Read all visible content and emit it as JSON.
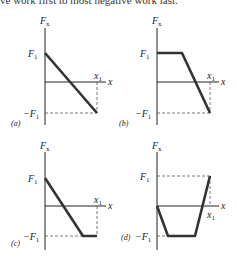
{
  "header": {
    "text": "ve work first to most negative work last."
  },
  "panels": [
    {
      "id": "a",
      "tag": "(a)",
      "y_label": "F",
      "y_sub": "x",
      "pos_label": "F",
      "pos_sub": "1",
      "neg_label": "−F",
      "neg_sub": "1",
      "x_label": "x",
      "x1_label": "x",
      "x1_sub": "1"
    },
    {
      "id": "b",
      "tag": "(b)",
      "y_label": "F",
      "y_sub": "x",
      "pos_label": "F",
      "pos_sub": "1",
      "neg_label": "−F",
      "neg_sub": "1",
      "x_label": "x",
      "x1_label": "x",
      "x1_sub": "1"
    },
    {
      "id": "c",
      "tag": "(c)",
      "y_label": "F",
      "y_sub": "x",
      "pos_label": "F",
      "pos_sub": "1",
      "neg_label": "−F",
      "neg_sub": "1",
      "x_label": "x",
      "x1_label": "x",
      "x1_sub": "1"
    },
    {
      "id": "d",
      "tag": "(d)",
      "y_label": "F",
      "y_sub": "x",
      "pos_label": "F",
      "pos_sub": "1",
      "neg_label": "−F",
      "neg_sub": "1",
      "x_label": "x",
      "x1_label": "x",
      "x1_sub": "1"
    }
  ],
  "curves": {
    "a": "F1 at x=0 decreasing linearly to -F1 at x1",
    "b": "constant F1 until ~0.45 x1, then linear decrease to -F1 at x1",
    "c": "F1 at x=0 decreasing linearly to -F1 at ~0.73 x1, then constant -F1 to x1",
    "d": "0 at x=0 decreasing to -F1 at ~0.2 x1, constant -F1 until ~0.7 x1, then linear increase to F1 at x1"
  }
}
